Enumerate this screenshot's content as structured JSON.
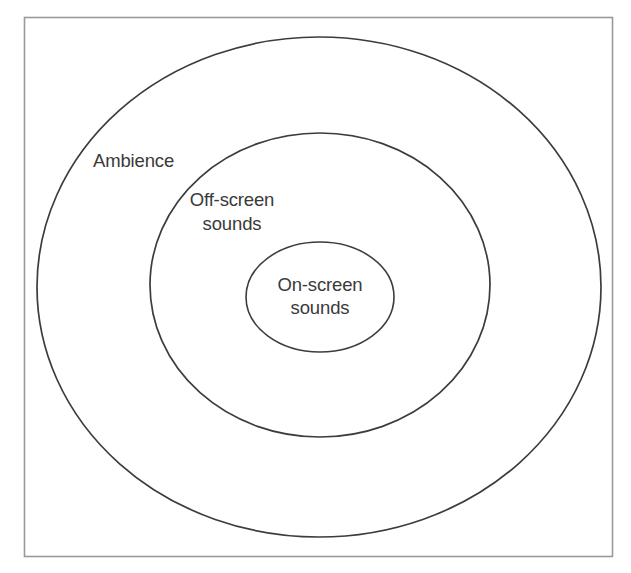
{
  "diagram": {
    "background_color": "#ffffff",
    "frame": {
      "name": "outer frame border",
      "stroke_color": "#9a9a9a"
    },
    "stroke_color": "#3c3c3c",
    "text_color": "#3a3a3a",
    "rings": [
      {
        "id": "ambience",
        "label_lines": [
          "Ambience"
        ],
        "label_position": "inside top-left of outermost ellipse",
        "cx": 319,
        "cy": 287,
        "rx": 282,
        "ry": 250,
        "label_x": 93,
        "label_y": 167
      },
      {
        "id": "off-screen-sounds",
        "label_lines": [
          "Off-screen",
          "sounds"
        ],
        "label_position": "inside top-left of middle ellipse",
        "cx": 320,
        "cy": 285,
        "rx": 170,
        "ry": 152,
        "label_x": 232,
        "label_y": 206
      },
      {
        "id": "on-screen-sounds",
        "label_lines": [
          "On-screen",
          "sounds"
        ],
        "label_position": "centered inside innermost circle",
        "cx": 320,
        "cy": 297,
        "rx": 74,
        "ry": 55,
        "label_x": 320,
        "label_y": 291
      }
    ]
  }
}
